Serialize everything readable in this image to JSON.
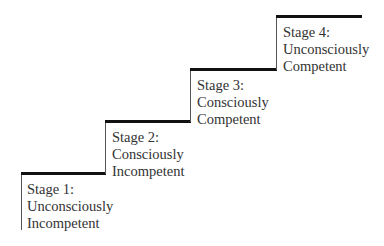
{
  "stages": [
    {
      "title": "Stage 1:",
      "line1": "Unconsciously",
      "line2": "Incompetent"
    },
    {
      "title": "Stage 2:",
      "line1": "Consciously",
      "line2": "Incompetent"
    },
    {
      "title": "Stage 3:",
      "line1": "Consciously",
      "line2": "Competent"
    },
    {
      "title": "Stage 4:",
      "line1": "Unconsciously",
      "line2": "Competent"
    }
  ],
  "colors": {
    "tread": "#111111",
    "riser": "#555555",
    "text": "#333333"
  }
}
